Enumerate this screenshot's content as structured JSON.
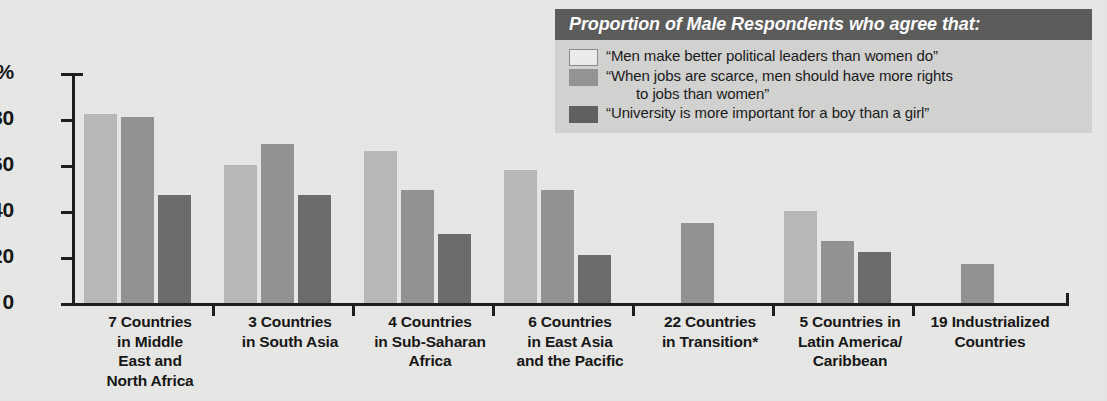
{
  "legend": {
    "title": "Proportion of Male Respondents who agree that:",
    "items": [
      {
        "series": "s0",
        "label": "“Men make better political leaders than women do”",
        "continuation": ""
      },
      {
        "series": "s1",
        "label": "“When jobs are scarce, men should have more rights",
        "continuation": "to jobs than women”"
      },
      {
        "series": "s2",
        "label": "“University is more important for a boy than a girl”",
        "continuation": ""
      }
    ]
  },
  "axis": {
    "y_ticks": [
      "100%",
      "80",
      "60",
      "40",
      "20",
      "0"
    ],
    "y_tick_values": [
      100,
      80,
      60,
      40,
      20,
      0
    ]
  },
  "colors": {
    "series_0": "#b9b9b7",
    "series_1": "#939391",
    "series_2": "#6b6b6a",
    "background": "#e9e9e7",
    "legend_background": "#d3d3d1",
    "legend_header": "#5a5a59",
    "axis": "#1b1b1b",
    "text": "#141414"
  },
  "chart_data": {
    "type": "bar",
    "title": "Proportion of Male Respondents who agree that:",
    "xlabel": "",
    "ylabel": "",
    "ylim": [
      0,
      100
    ],
    "ytick_labels": [
      "100%",
      "80",
      "60",
      "40",
      "20",
      "0"
    ],
    "grid": false,
    "legend_position": "top-right",
    "categories": [
      "7 Countries in Middle East and North Africa",
      "3 Countries in South Asia",
      "4 Countries in Sub-Saharan Africa",
      "6 Countries in East Asia and the Pacific",
      "22 Countries in Transition*",
      "5 Countries in Latin America/Caribbean",
      "19 Industrialized Countries"
    ],
    "category_lines": [
      [
        "7 Countries",
        "in Middle",
        "East and",
        "North Africa"
      ],
      [
        "3 Countries",
        "in South Asia"
      ],
      [
        "4 Countries",
        "in Sub-Saharan",
        "Africa"
      ],
      [
        "6 Countries",
        "in East Asia",
        "and the Pacific"
      ],
      [
        "22 Countries",
        "in Transition*"
      ],
      [
        "5 Countries in",
        "Latin America/",
        "Caribbean"
      ],
      [
        "19 Industrialized",
        "Countries"
      ]
    ],
    "series": [
      {
        "name": "“Men make better political leaders than women do”",
        "color": "#b9b9b7",
        "values": [
          82,
          60,
          66,
          58,
          null,
          40,
          null
        ]
      },
      {
        "name": "“When jobs are scarce, men should have more rights to jobs than women”",
        "color": "#939391",
        "values": [
          81,
          69,
          49,
          49,
          35,
          27,
          17
        ]
      },
      {
        "name": "“University is more important for a boy than a girl”",
        "color": "#6b6b6a",
        "values": [
          47,
          47,
          30,
          21,
          null,
          22,
          null
        ]
      }
    ]
  },
  "layout": {
    "group_starts": [
      12,
      152,
      292,
      432,
      572,
      712,
      852
    ],
    "bar_width": 33,
    "bar_gap": 4,
    "group_pitch": 140,
    "plot_height": 230,
    "single_bar_offset": 37,
    "tick_positions": [
      140,
      280,
      420,
      560,
      700,
      840
    ]
  }
}
